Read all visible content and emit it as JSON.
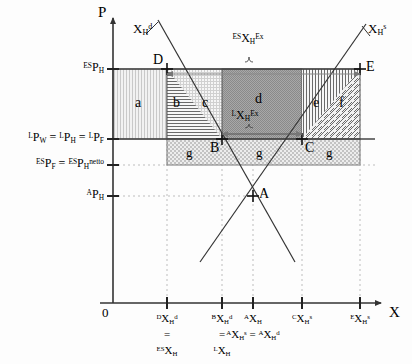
{
  "figure": {
    "type": "economics-diagram"
  },
  "axes": {
    "y_label": "P",
    "x_label": "X",
    "origin_label": "0"
  },
  "y_ticks": [
    {
      "id": "es-ph",
      "text_html": "<span class='pre'>ES</span>P<sub>H</sub>",
      "y": 69
    },
    {
      "id": "l-pw",
      "text_html": "<span class='pre'>L</span>P<sub>W</sub> = <span class='pre'>L</span>P<sub>H</sub> = <span class='pre'>L</span>P<sub>F</sub>",
      "y": 139
    },
    {
      "id": "es-pf",
      "text_html": "<span class='pre'>ES</span>P<sub>F</sub> = <span class='pre'>ES</span>P<sub>H</sub><sup>netto</sup>",
      "y": 165
    },
    {
      "id": "a-ph",
      "text_html": "<span class='pre'>A</span>P<sub>H</sub>",
      "y": 196
    }
  ],
  "x_ticks": [
    {
      "id": "d-xhd",
      "x": 167,
      "line1": "<span class='pre'>D</span>X<sub>H</sub><sup>d</sup>",
      "line2": "=",
      "line3": "<span class='pre'>ES</span>X<sub>H</sub>"
    },
    {
      "id": "b-xhd",
      "x": 222,
      "line1": "<span class='pre'>B</span>X<sub>H</sub><sup>d</sup>",
      "line2": "=",
      "line3": "<span class='pre'>L</span>X<sub>H</sub>"
    },
    {
      "id": "a-xh",
      "x": 253,
      "line1": "<span class='pre'>A</span>X<sub>H</sub>",
      "line2": "<span class='pre'>A</span>X<sub>H</sub><sup>s</sup> = <span class='pre'>A</span>X<sub>H</sub><sup>d</sup>",
      "line3": ""
    },
    {
      "id": "c-xhs",
      "x": 302,
      "line1": "<span class='pre'>C</span>X<sub>H</sub><sup>s</sup>",
      "line2": "",
      "line3": ""
    },
    {
      "id": "e-xhs",
      "x": 360,
      "line1": "<span class='pre'>E</span>X<sub>H</sub><sup>s</sup>",
      "line2": "",
      "line3": ""
    }
  ],
  "curves": [
    {
      "id": "demand",
      "label_html": "X<sub>H</sub><sup>d</sup>",
      "label_x": 133,
      "label_y": 22
    },
    {
      "id": "supply",
      "label_html": "X<sub>H</sub><sup>s</sup>",
      "label_x": 368,
      "label_y": 22
    }
  ],
  "points": [
    {
      "id": "D",
      "label": "D",
      "x": 167,
      "y": 69,
      "label_dx": -14,
      "label_dy": -16
    },
    {
      "id": "E",
      "label": "E",
      "x": 360,
      "y": 69,
      "label_dx": 6,
      "label_dy": -9
    },
    {
      "id": "B",
      "label": "B",
      "x": 222,
      "y": 139,
      "label_dx": -12,
      "label_dy": 2
    },
    {
      "id": "C",
      "label": "C",
      "x": 302,
      "y": 139,
      "label_dx": 3,
      "label_dy": 2
    },
    {
      "id": "A",
      "label": "A",
      "x": 253,
      "y": 196,
      "label_dx": 6,
      "label_dy": -9
    }
  ],
  "regions": [
    {
      "id": "a",
      "label": "a",
      "x": 113,
      "y": 69,
      "w": 54,
      "h": 70,
      "pattern": "vdots",
      "cx": 140,
      "cy": 104
    },
    {
      "id": "b",
      "label": "b",
      "x": 167,
      "y": 69,
      "w": 28,
      "h": 70,
      "pattern": "hline",
      "cx": 178,
      "cy": 104
    },
    {
      "id": "c",
      "label": "c",
      "x": 167,
      "y": 69,
      "w": 55,
      "h": 70,
      "pattern": "grid",
      "cx": 207,
      "cy": 104
    },
    {
      "id": "d",
      "label": "d",
      "x": 222,
      "y": 69,
      "w": 80,
      "h": 70,
      "pattern": "dense",
      "cx": 260,
      "cy": 100
    },
    {
      "id": "e",
      "label": "e",
      "x": 302,
      "y": 69,
      "w": 58,
      "h": 70,
      "pattern": "vline",
      "cx": 318,
      "cy": 104
    },
    {
      "id": "f",
      "label": "f",
      "x": 302,
      "y": 69,
      "w": 58,
      "h": 70,
      "pattern": "diag",
      "cx": 344,
      "cy": 104
    },
    {
      "id": "g",
      "label": "g",
      "x": 167,
      "y": 139,
      "w": 193,
      "h": 26,
      "pattern": "dots",
      "cx": 190,
      "cy": 153
    }
  ],
  "region_g_labels": [
    {
      "label": "g",
      "cx": 190,
      "cy": 154
    },
    {
      "label": "g",
      "cx": 260,
      "cy": 154
    },
    {
      "label": "g",
      "cx": 330,
      "cy": 154
    }
  ],
  "braces": [
    {
      "id": "es-export",
      "label_html": "<span class='pre'>ES</span>X<sub>H</sub><sup>Ex</sup>",
      "x1": 167,
      "x2": 360,
      "y": 69,
      "label_x": 248,
      "label_y": 40
    },
    {
      "id": "l-export",
      "label_html": "<span class='pre'>L</span>X<sub>H</sub><sup>Ex</sup>",
      "x1": 222,
      "x2": 302,
      "y": 139,
      "label_x": 245,
      "label_y": 117
    }
  ]
}
